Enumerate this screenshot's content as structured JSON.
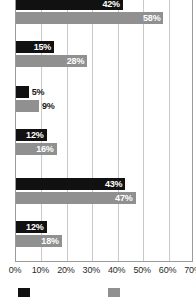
{
  "chart_data": {
    "type": "bar",
    "orientation": "horizontal",
    "title": "",
    "xlabel": "",
    "ylabel": "",
    "xlim": [
      0,
      70
    ],
    "xticks": [
      "0%",
      "10%",
      "20%",
      "30%",
      "40%",
      "50%",
      "60%",
      "70%"
    ],
    "xtick_values": [
      0,
      10,
      20,
      30,
      40,
      50,
      60,
      70
    ],
    "grid": true,
    "legend_position": "bottom",
    "categories": [
      "",
      "",
      "",
      "",
      "",
      ""
    ],
    "series": [
      {
        "name": "Series 1",
        "color": "#111111",
        "values": [
          42,
          15,
          5,
          12,
          43,
          12
        ],
        "labels": [
          "42%",
          "15%",
          "5%",
          "12%",
          "43%",
          "12%"
        ]
      },
      {
        "name": "Series 2",
        "color": "#909090",
        "values": [
          58,
          28,
          9,
          16,
          47,
          18
        ],
        "labels": [
          "58%",
          "28%",
          "9%",
          "16%",
          "47%",
          "18%"
        ]
      }
    ]
  },
  "legend": {
    "items": [
      {
        "label": "",
        "color": "#111111",
        "swatch": "dark"
      },
      {
        "label": "",
        "color": "#909090",
        "swatch": "light"
      }
    ]
  },
  "axis": {
    "ticks": [
      "0%",
      "10%",
      "20%",
      "30%",
      "40%",
      "50%",
      "60%",
      "70%"
    ]
  },
  "groups": [
    {
      "dark": "42%",
      "light": "58%",
      "dark_val": 42,
      "light_val": 58
    },
    {
      "dark": "15%",
      "light": "28%",
      "dark_val": 15,
      "light_val": 28
    },
    {
      "dark": "5%",
      "light": "9%",
      "dark_val": 5,
      "light_val": 9
    },
    {
      "dark": "12%",
      "light": "16%",
      "dark_val": 12,
      "light_val": 16
    },
    {
      "dark": "43%",
      "light": "47%",
      "dark_val": 43,
      "light_val": 47
    },
    {
      "dark": "12%",
      "light": "18%",
      "dark_val": 12,
      "light_val": 18
    }
  ]
}
